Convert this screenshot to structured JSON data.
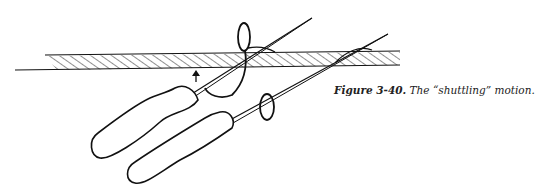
{
  "figure": {
    "illustration": "Two awls/needles with handles shuttling a thread through a hatched strip of material",
    "caption": {
      "label": "Figure 3-40.",
      "text": "The “shuttling” motion."
    }
  }
}
